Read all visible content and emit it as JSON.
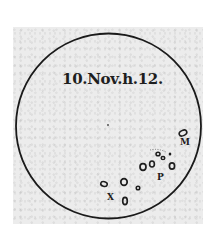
{
  "figure": {
    "caption": "10.Nov.h.12.",
    "disk": {
      "cx": 108.5,
      "cy": 126,
      "r": 92.5,
      "stroke": "#1a1a1a"
    },
    "spot_labels": [
      {
        "text": "M",
        "x": 180,
        "y": 142
      },
      {
        "text": "P",
        "x": 157,
        "y": 170
      },
      {
        "text": "X",
        "x": 107,
        "y": 192
      }
    ],
    "paper_color": "#ececec",
    "ink_color": "#1e1e1e"
  }
}
